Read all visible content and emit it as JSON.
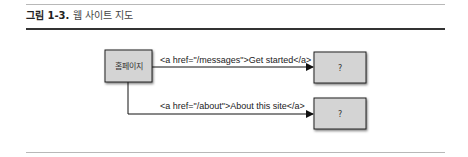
{
  "figure": {
    "caption_label": "그림 1-3.",
    "caption_text": " 웹 사이트 지도"
  },
  "diagram": {
    "nodes": [
      {
        "id": "home",
        "label": "홈페이지"
      },
      {
        "id": "target1",
        "label": "?"
      },
      {
        "id": "target2",
        "label": "?"
      }
    ],
    "edges": [
      {
        "from": "home",
        "to": "target1",
        "label": "<a href=\"/messages\">Get started</a>"
      },
      {
        "from": "home",
        "to": "target2",
        "label": "<a href=\"/about\">About this site</a>"
      }
    ],
    "colors": {
      "box_fill": "#d4d4d4",
      "box_stroke": "#222222",
      "line": "#111111"
    }
  }
}
